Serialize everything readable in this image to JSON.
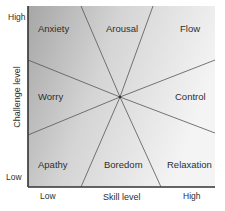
{
  "diagram": {
    "y_axis": {
      "label": "Challenge level",
      "high": "High",
      "low": "Low"
    },
    "x_axis": {
      "label": "Skill level",
      "low": "Low",
      "high": "High"
    },
    "regions": [
      {
        "id": "anxiety",
        "label": "Anxiety"
      },
      {
        "id": "arousal",
        "label": "Arousal"
      },
      {
        "id": "flow",
        "label": "Flow"
      },
      {
        "id": "worry",
        "label": "Worry"
      },
      {
        "id": "control",
        "label": "Control"
      },
      {
        "id": "apathy",
        "label": "Apathy"
      },
      {
        "id": "boredom",
        "label": "Boredom"
      },
      {
        "id": "relaxation",
        "label": "Relaxation"
      }
    ],
    "colors": {
      "dark": "#a8a8a8",
      "mid": "#d0d0d0",
      "light": "#f2f2f2",
      "line": "#555555",
      "axis": "#333333"
    }
  }
}
